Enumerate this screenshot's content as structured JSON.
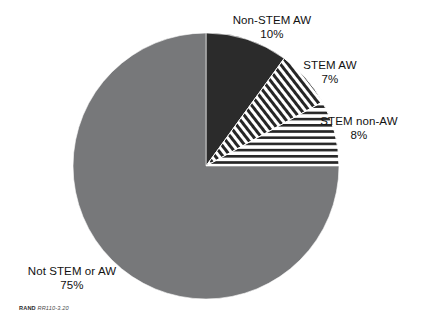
{
  "figure": {
    "background": "#ffffff",
    "credit_prefix": "RAND",
    "credit_code": "RR110-3.20"
  },
  "chart_data": {
    "type": "pie",
    "title": "",
    "subtitle": "",
    "xlabel": "",
    "ylabel": "",
    "legend_position": "none",
    "grid": false,
    "labels_outside": true,
    "start_angle_deg": 0,
    "direction": "clockwise",
    "categories": [
      "Non-STEM AW",
      "STEM AW",
      "STEM non-AW",
      "Not STEM or AW"
    ],
    "values": [
      10,
      7,
      8,
      75
    ],
    "value_unit": "%",
    "slices": [
      {
        "label": "Non-STEM AW",
        "value": 10,
        "value_text": "10%",
        "fill": "#2b2b2b",
        "pattern": "solid",
        "start_deg": 0,
        "end_deg": 36
      },
      {
        "label": "STEM AW",
        "value": 7,
        "value_text": "7%",
        "fill": "#2b2b2b",
        "pattern": "diagonal-stripes",
        "start_deg": 36,
        "end_deg": 61.2
      },
      {
        "label": "STEM non-AW",
        "value": 8,
        "value_text": "8%",
        "fill": "#2b2b2b",
        "pattern": "horizontal-stripes",
        "start_deg": 61.2,
        "end_deg": 90
      },
      {
        "label": "Not STEM or AW",
        "value": 75,
        "value_text": "75%",
        "fill": "#77787a",
        "pattern": "solid",
        "start_deg": 90,
        "end_deg": 360
      }
    ],
    "geometry": {
      "center_x": 206,
      "center_y": 166,
      "radius": 133
    }
  },
  "labels": {
    "non_stem_aw": {
      "name": "Non-STEM AW",
      "pct": "10%"
    },
    "stem_aw": {
      "name": "STEM AW",
      "pct": "7%"
    },
    "stem_non_aw": {
      "name": "STEM non-AW",
      "pct": "8%"
    },
    "not_stem_or_aw": {
      "name": "Not STEM or AW",
      "pct": "75%"
    }
  }
}
